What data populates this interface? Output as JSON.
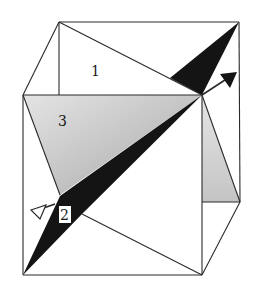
{
  "diagram": {
    "type": "cube-with-planes",
    "colors": {
      "edge": "#2a2a2a",
      "plane_black": "#141414",
      "plane_shaded": "#c9c9c9",
      "plane_shaded_light": "#e2e2e2",
      "background": "#ffffff"
    },
    "vertices": {
      "back_top_left": [
        59,
        22
      ],
      "back_top_right": [
        239,
        22
      ],
      "back_bottom_right": [
        240,
        202
      ],
      "front_top_left": [
        23,
        95
      ],
      "front_top_right": [
        202,
        95
      ],
      "front_bottom_left": [
        23,
        275
      ],
      "front_bottom_right": [
        202,
        275
      ]
    },
    "planes": [
      {
        "id": "1",
        "label": "1",
        "fill": "white",
        "label_pos": [
          95,
          75
        ]
      },
      {
        "id": "2",
        "label": "2",
        "fill": "black",
        "label_pos": [
          65,
          219
        ]
      },
      {
        "id": "3",
        "label": "3",
        "fill": "shaded",
        "label_pos": [
          63,
          125
        ]
      }
    ],
    "arrows": [
      {
        "name": "axis-arrow-forward",
        "from": [
          202,
          95
        ],
        "to": [
          236,
          72
        ],
        "head": "filled"
      },
      {
        "name": "axis-arrow-back",
        "from": [
          55,
          205
        ],
        "to": [
          31,
          212
        ],
        "head": "open"
      }
    ]
  }
}
